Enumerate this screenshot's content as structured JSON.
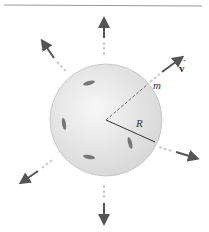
{
  "diagram": {
    "labels": {
      "velocity": "v",
      "mass": "m",
      "radius": "R"
    },
    "colors": {
      "sphere_fill": "#e6e6e6",
      "sphere_edge": "#b5b5b5",
      "arrow": "#555555",
      "rule_line": "#888888"
    },
    "arrow_count": 8
  }
}
